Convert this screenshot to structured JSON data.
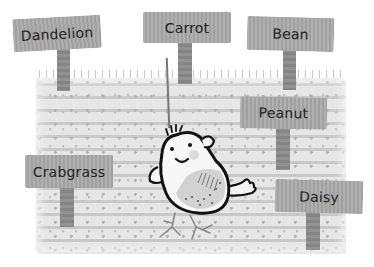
{
  "scene": {
    "description": "Children's book illustration of a garden plot with plant marker signs and a smiling bird hanging from a string",
    "colors": {
      "background": "#ffffff",
      "soil": "#e6e6e6",
      "sign_board": "#a9a9a9",
      "sign_post": "#8c8c8c",
      "outline": "#111111"
    }
  },
  "signs": [
    {
      "label": "Dandelion"
    },
    {
      "label": "Carrot"
    },
    {
      "label": "Bean"
    },
    {
      "label": "Peanut"
    },
    {
      "label": "Crabgrass"
    },
    {
      "label": "Daisy"
    }
  ],
  "character": {
    "name": "hanging-bird",
    "expression": "smile"
  }
}
